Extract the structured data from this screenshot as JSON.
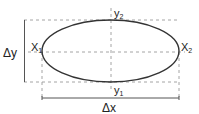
{
  "diagram": {
    "title": "",
    "shape": "ellipse",
    "labels": {
      "top_point": "y",
      "top_point_sub": "2",
      "bottom_point": "y",
      "bottom_point_sub": "1",
      "left_point": "X",
      "left_point_sub": "1",
      "right_point": "X",
      "right_point_sub": "2",
      "height_dimension": "Δy",
      "width_dimension": "Δx"
    },
    "colors": {
      "stroke": "#333333",
      "dashed": "#9a9a9a",
      "dimension": "#555555",
      "background": "#ffffff"
    }
  }
}
